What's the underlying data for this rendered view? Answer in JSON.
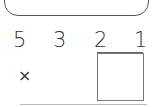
{
  "problem": {
    "digits": [
      "5",
      "3",
      "2",
      "1"
    ],
    "operator": "×",
    "answer_box_value": ""
  }
}
